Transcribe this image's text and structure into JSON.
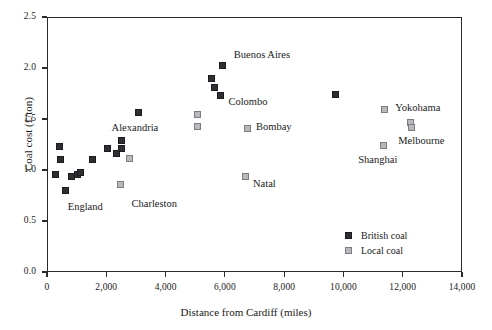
{
  "chart_data": {
    "type": "scatter",
    "title": "",
    "xlabel": "Distance from Cardiff (miles)",
    "ylabel": "Coal cost (£/ton)",
    "xlim": [
      0,
      14000
    ],
    "ylim": [
      0.0,
      2.5
    ],
    "xticks": [
      0,
      2000,
      4000,
      6000,
      8000,
      10000,
      12000,
      14000
    ],
    "xtick_labels": [
      "0",
      "2,000",
      "4,000",
      "6,000",
      "8,000",
      "10,000",
      "12,000",
      "14,000"
    ],
    "yticks": [
      0.0,
      0.5,
      1.0,
      1.5,
      2.0,
      2.5
    ],
    "ytick_labels": [
      "0.0",
      "0.5",
      "1.0",
      "1.5",
      "2.0",
      "2.5"
    ],
    "grid": false,
    "legend_position": "lower right",
    "series": [
      {
        "name": "British coal",
        "color": "#2e2e33",
        "marker": "filled-square",
        "points": [
          {
            "x": 270,
            "y": 0.96
          },
          {
            "x": 420,
            "y": 1.23
          },
          {
            "x": 440,
            "y": 1.1
          },
          {
            "x": 640,
            "y": 0.8
          },
          {
            "x": 830,
            "y": 0.94
          },
          {
            "x": 1030,
            "y": 0.96
          },
          {
            "x": 1130,
            "y": 0.98
          },
          {
            "x": 1530,
            "y": 1.1
          },
          {
            "x": 2030,
            "y": 1.21
          },
          {
            "x": 2330,
            "y": 1.16
          },
          {
            "x": 2520,
            "y": 1.29
          },
          {
            "x": 2520,
            "y": 1.21
          },
          {
            "x": 3080,
            "y": 1.56
          },
          {
            "x": 5560,
            "y": 1.9
          },
          {
            "x": 5930,
            "y": 2.02
          },
          {
            "x": 5660,
            "y": 1.81
          },
          {
            "x": 5860,
            "y": 1.73
          },
          {
            "x": 9720,
            "y": 1.74
          }
        ]
      },
      {
        "name": "Local coal",
        "color": "#b9b9bd",
        "marker": "open-square",
        "points": [
          {
            "x": 2470,
            "y": 0.86
          },
          {
            "x": 2780,
            "y": 1.11
          },
          {
            "x": 5080,
            "y": 1.54
          },
          {
            "x": 5080,
            "y": 1.43
          },
          {
            "x": 6690,
            "y": 0.94
          },
          {
            "x": 6760,
            "y": 1.41
          },
          {
            "x": 11400,
            "y": 1.59
          },
          {
            "x": 11350,
            "y": 1.24
          },
          {
            "x": 12270,
            "y": 1.47
          },
          {
            "x": 12300,
            "y": 1.42
          }
        ]
      }
    ],
    "annotations": [
      {
        "text": "England",
        "x": 700,
        "y": 0.63
      },
      {
        "text": "Alexandria",
        "x": 2180,
        "y": 1.4
      },
      {
        "text": "Charleston",
        "x": 2850,
        "y": 0.66
      },
      {
        "text": "Buenos Aires",
        "x": 6300,
        "y": 2.12
      },
      {
        "text": "Colombo",
        "x": 6120,
        "y": 1.66
      },
      {
        "text": "Bombay",
        "x": 7050,
        "y": 1.41
      },
      {
        "text": "Natal",
        "x": 6950,
        "y": 0.85
      },
      {
        "text": "Shanghai",
        "x": 10500,
        "y": 1.09
      },
      {
        "text": "Yokohama",
        "x": 11750,
        "y": 1.6
      },
      {
        "text": "Melbourne",
        "x": 11850,
        "y": 1.27
      }
    ]
  },
  "axes": {
    "y_title": "Coal cost (£/ton)",
    "x_title": "Distance from Cardiff (miles)"
  },
  "legend": {
    "entries": [
      {
        "label": "British coal",
        "swatch": "filled-dark-square"
      },
      {
        "label": "Local coal",
        "swatch": "light-gray-square"
      }
    ]
  }
}
